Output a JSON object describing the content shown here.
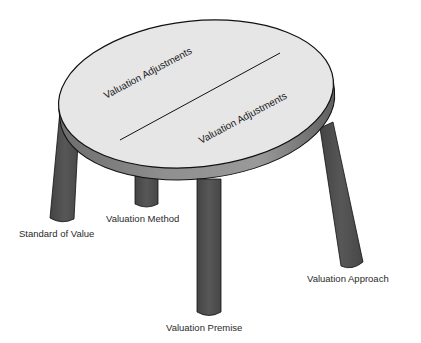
{
  "diagram": {
    "type": "table-metaphor",
    "tabletop": {
      "sections": [
        {
          "label": "Valuation Adjustments"
        },
        {
          "label": "Valuation Adjustments"
        }
      ]
    },
    "legs": [
      {
        "label": "Standard of Value"
      },
      {
        "label": "Valuation Method"
      },
      {
        "label": "Valuation Premise"
      },
      {
        "label": "Valuation Approach"
      }
    ]
  },
  "colors": {
    "background": "#ffffff",
    "tabletop_fill": "#e6e6e6",
    "rim_fill": "#8c8c8c",
    "leg_fill": "#505050",
    "outline": "#111111",
    "text": "#2a2a2a"
  }
}
